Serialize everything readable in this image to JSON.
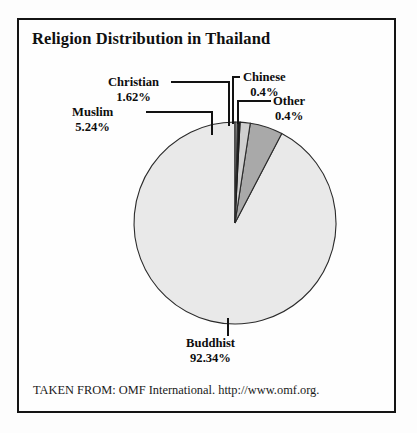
{
  "chart_data": {
    "type": "pie",
    "title": "Religion Distribution in Thailand",
    "categories": [
      "Buddhist",
      "Muslim",
      "Christian",
      "Chinese",
      "Other"
    ],
    "values": [
      92.34,
      5.24,
      1.62,
      0.4,
      0.4
    ],
    "value_labels": [
      "92.34%",
      "5.24%",
      "1.62%",
      "0.4%",
      "0.4%"
    ],
    "unit": "%",
    "legend_position": "callout-labels",
    "grid": false,
    "xlabel": "",
    "ylabel": "",
    "slice_colors": [
      "#e9e9e9",
      "#a9a9a9",
      "#cfcfcf",
      "#1c1c1c",
      "#8a8a8a"
    ],
    "start_angle_deg": -90,
    "direction": "counterclockwise",
    "slices": [
      {
        "name": "Buddhist",
        "value": 92.34,
        "label": "Buddhist",
        "pct": "92.34%",
        "color": "#e9e9e9"
      },
      {
        "name": "Muslim",
        "value": 5.24,
        "label": "Muslim",
        "pct": "5.24%",
        "color": "#a9a9a9"
      },
      {
        "name": "Christian",
        "value": 1.62,
        "label": "Christian",
        "pct": "1.62%",
        "color": "#cfcfcf"
      },
      {
        "name": "Chinese",
        "value": 0.4,
        "label": "Chinese",
        "pct": "0.4%",
        "color": "#1c1c1c"
      },
      {
        "name": "Other",
        "value": 0.4,
        "label": "Other",
        "pct": "0.4%",
        "color": "#8a8a8a"
      }
    ]
  },
  "source": {
    "note": "TAKEN FROM: OMF International. http://www.omf.org."
  }
}
